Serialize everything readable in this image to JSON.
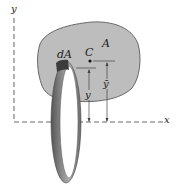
{
  "diagram": {
    "type": "moment-of-inertia / centroid figure",
    "labels": {
      "y_axis": "y",
      "x_axis": "x",
      "area": "A",
      "centroid": "C",
      "element": "dA",
      "element_distance": "y",
      "centroid_distance": "ȳ"
    },
    "colors": {
      "area_fill": "#bdbdbd",
      "area_stroke": "#5a5a5a",
      "axis": "#555555",
      "ring_dark": "#5c5c5c",
      "ring_light": "#a8a8a8",
      "text": "#222222"
    }
  }
}
